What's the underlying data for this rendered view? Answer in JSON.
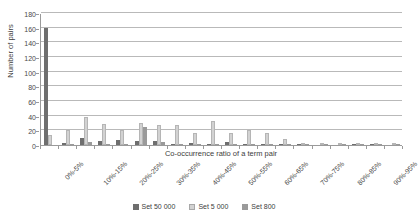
{
  "chart_data": {
    "type": "bar",
    "title": "",
    "xlabel": "Co-occurrence ratio of a term pair",
    "ylabel": "Number of pairs",
    "ylim": [
      0,
      180
    ],
    "ytick_step": 20,
    "yticks": [
      0,
      20,
      40,
      60,
      80,
      100,
      120,
      140,
      160,
      180
    ],
    "grid": "horizontal",
    "legend_position": "bottom-center",
    "label_rotation_deg": -45,
    "labelled_every_nth_category": 2,
    "categories": [
      "0%-5%",
      "5%-10%",
      "10%-15%",
      "15%-20%",
      "20%-25%",
      "25%-30%",
      "30%-35%",
      "35%-40%",
      "40%-45%",
      "45%-50%",
      "50%-55%",
      "55%-60%",
      "60%-65%",
      "65%-70%",
      "70%-75%",
      "75%-80%",
      "80%-85%",
      "85%-90%",
      "90%-95%",
      "95%-100%"
    ],
    "visible_tick_labels": [
      "0%-5%",
      "10%-15%",
      "20%-25%",
      "30%-35%",
      "40%-45%",
      "50%-55%",
      "60%-65%",
      "70%-75%",
      "80%-85%",
      "90%-95%"
    ],
    "series": [
      {
        "name": "Set 50 000",
        "color": "#6e6e6e",
        "values": [
          160,
          3,
          10,
          6,
          7,
          6,
          5,
          2,
          3,
          1,
          4,
          1,
          2,
          1,
          1,
          0,
          0,
          1,
          1,
          0
        ]
      },
      {
        "name": "Set 5 000",
        "color": "#d2d2d2",
        "values": [
          14,
          21,
          38,
          29,
          20,
          30,
          27,
          27,
          16,
          33,
          16,
          21,
          17,
          8,
          2,
          2,
          2,
          2,
          3,
          1
        ]
      },
      {
        "name": "Set 800",
        "color": "#9a9a9a",
        "values": [
          0,
          2,
          4,
          2,
          2,
          25,
          4,
          2,
          2,
          2,
          2,
          2,
          1,
          1,
          1,
          1,
          1,
          1,
          2,
          1
        ]
      }
    ]
  },
  "legend": {
    "items": [
      {
        "label": "Set 50 000"
      },
      {
        "label": "Set 5 000"
      },
      {
        "label": "Set 800"
      }
    ]
  }
}
